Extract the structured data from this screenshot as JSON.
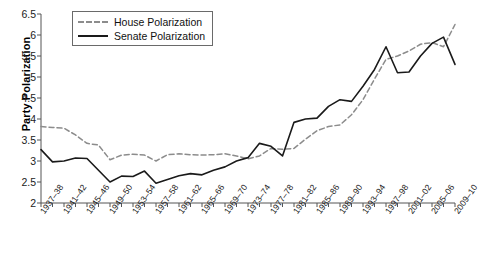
{
  "chart_data": {
    "type": "line",
    "title": "",
    "xlabel": "",
    "ylabel": "Party Polarization",
    "ylim": [
      2,
      6.5
    ],
    "ytick_step": 0.5,
    "yticks": [
      "6.5",
      "6",
      "5.5",
      "5",
      "4.5",
      "4",
      "3.5",
      "3",
      "2.5",
      "2"
    ],
    "grid": false,
    "legend_position": "top-left",
    "categories": [
      "1937-38",
      "1939-40",
      "1941-42",
      "1943-44",
      "1945-46",
      "1947-48",
      "1949-50",
      "1951-52",
      "1953-54",
      "1955-56",
      "1957-58",
      "1959-60",
      "1961-62",
      "1963-64",
      "1965-66",
      "1967-68",
      "1969-70",
      "1971-72",
      "1973-74",
      "1975-76",
      "1977-78",
      "1979-80",
      "1981-82",
      "1983-84",
      "1985-86",
      "1987-88",
      "1989-90",
      "1991-92",
      "1993-94",
      "1995-96",
      "1997-98",
      "1999-2000",
      "2001-02",
      "2003-04",
      "2005-06",
      "2007-08",
      "2009-10"
    ],
    "xtick_labels": [
      "1937–38",
      "1941–42",
      "1945–46",
      "1949–50",
      "1953–54",
      "1957–58",
      "1961–62",
      "1965–66",
      "1969–70",
      "1973–74",
      "1977–78",
      "1981–82",
      "1985–86",
      "1989–90",
      "1993–94",
      "1997–98",
      "2001–02",
      "2005–06",
      "2009–10"
    ],
    "xtick_indices": [
      0,
      2,
      4,
      6,
      8,
      10,
      12,
      14,
      16,
      18,
      20,
      22,
      24,
      26,
      28,
      30,
      32,
      34,
      36
    ],
    "series": [
      {
        "name": "House Polarization",
        "style": "dashed",
        "color": "#8c8c8c",
        "values": [
          3.82,
          3.8,
          3.78,
          3.62,
          3.42,
          3.38,
          3.03,
          3.14,
          3.16,
          3.14,
          3.0,
          3.15,
          3.17,
          3.15,
          3.14,
          3.15,
          3.17,
          3.12,
          3.05,
          3.12,
          3.3,
          3.28,
          3.3,
          3.52,
          3.72,
          3.82,
          3.86,
          4.1,
          4.46,
          4.95,
          5.42,
          5.5,
          5.62,
          5.78,
          5.82,
          5.72,
          6.25
        ]
      },
      {
        "name": "Senate Polarization",
        "style": "solid",
        "color": "#1a1a1a",
        "values": [
          3.27,
          2.98,
          3.0,
          3.07,
          3.06,
          2.78,
          2.5,
          2.64,
          2.63,
          2.76,
          2.47,
          2.56,
          2.65,
          2.7,
          2.67,
          2.78,
          2.86,
          3.0,
          3.08,
          3.42,
          3.35,
          3.12,
          3.92,
          4.0,
          4.02,
          4.3,
          4.46,
          4.42,
          4.78,
          5.18,
          5.72,
          5.1,
          5.12,
          5.5,
          5.8,
          5.95,
          5.3
        ]
      }
    ]
  },
  "legend": {
    "items": [
      {
        "label": "House Polarization",
        "style": "dashed"
      },
      {
        "label": "Senate Polarization",
        "style": "solid"
      }
    ]
  }
}
